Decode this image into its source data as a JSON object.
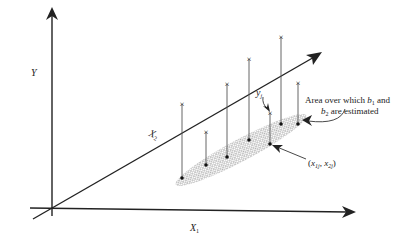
{
  "figure": {
    "type": "3D regression diagram",
    "axes": {
      "y_label": "Y",
      "x1_label": "X",
      "x1_sub": "1",
      "x2_label": "X",
      "x2_sub": "2"
    },
    "annotations": {
      "yj_label": "y",
      "yj_sub": "j",
      "area_line1_pre": "Area over which ",
      "area_b1": "b",
      "area_b1_sub": "1",
      "area_line1_post": " and",
      "area_b2": "b",
      "area_b2_sub": "2",
      "area_line2_post": " are estimated",
      "point_label_open": "(",
      "point_x1": "x",
      "point_x1_sub": "1j",
      "point_sep": ", ",
      "point_x2": "x",
      "point_x2_sub": "2j",
      "point_label_close": ")"
    },
    "observations": [
      {
        "x": 182,
        "top": 104,
        "base": 178
      },
      {
        "x": 206,
        "top": 132,
        "base": 165
      },
      {
        "x": 227,
        "top": 84,
        "base": 157
      },
      {
        "x": 249,
        "top": 59,
        "base": 140
      },
      {
        "x": 270,
        "top": 113,
        "base": 144
      },
      {
        "x": 281,
        "top": 37,
        "base": 124
      },
      {
        "x": 298,
        "top": 83,
        "base": 124
      }
    ],
    "colors": {
      "line": "#222222",
      "stem": "#555555",
      "shade": "#888888"
    }
  }
}
